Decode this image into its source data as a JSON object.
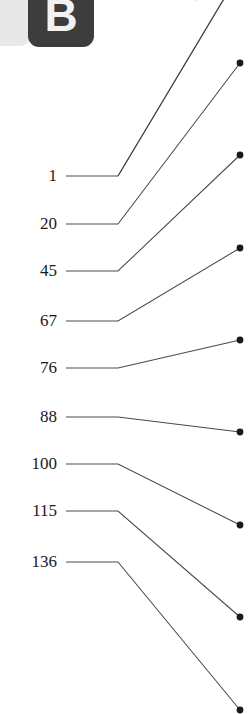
{
  "panel": {
    "badge_letter": "B",
    "badge_bg": "#3d3d3d",
    "badge_fg": "#f2f2f2",
    "backplate_bg": "#e8e8e8"
  },
  "figure": {
    "width": 251,
    "height": 714,
    "background": "#ffffff",
    "line_color": "#4a4a4a",
    "dot_color": "#1a1a1a",
    "label_color": "#1a1a1a"
  },
  "chart_data": {
    "type": "line",
    "title": "",
    "subtitle": "",
    "xlabel": "",
    "ylabel": "",
    "grid": false,
    "legend": null,
    "label_x": 57,
    "line_start_x": 66,
    "bend_x": 118,
    "dot_x": 240,
    "categories": [
      "1",
      "20",
      "45",
      "67",
      "76",
      "88",
      "100",
      "115",
      "136"
    ],
    "values": [
      1,
      20,
      45,
      67,
      76,
      88,
      100,
      115,
      136
    ],
    "leaves": [
      {
        "label": "1",
        "label_y": 176,
        "line_y": 176,
        "dot_y": -28,
        "dot_visible": false
      },
      {
        "label": "20",
        "label_y": 224,
        "line_y": 224,
        "dot_y": 63,
        "dot_visible": true
      },
      {
        "label": "45",
        "label_y": 271,
        "line_y": 271,
        "dot_y": 155,
        "dot_visible": true
      },
      {
        "label": "67",
        "label_y": 321,
        "line_y": 321,
        "dot_y": 248,
        "dot_visible": true
      },
      {
        "label": "76",
        "label_y": 368,
        "line_y": 368,
        "dot_y": 340,
        "dot_visible": true
      },
      {
        "label": "88",
        "label_y": 417,
        "line_y": 417,
        "dot_y": 432,
        "dot_visible": true
      },
      {
        "label": "100",
        "label_y": 464,
        "line_y": 464,
        "dot_y": 525,
        "dot_visible": true
      },
      {
        "label": "115",
        "label_y": 511,
        "line_y": 511,
        "dot_y": 617,
        "dot_visible": true
      },
      {
        "label": "136",
        "label_y": 562,
        "line_y": 562,
        "dot_y": 710,
        "dot_visible": true
      }
    ],
    "extra_paths": [
      {
        "from_x": 118,
        "from_y": 176,
        "to_x": 240,
        "to_y": -28
      },
      {
        "from_x": 196,
        "from_y": 0,
        "to_x": 240,
        "to_y": -28
      }
    ]
  }
}
